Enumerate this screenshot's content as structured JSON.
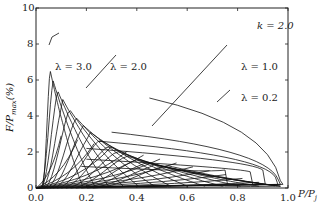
{
  "chart_data": {
    "type": "line",
    "title": "",
    "xlabel": "P/P_j",
    "ylabel": "F/P_max(%)",
    "xlim": [
      0.0,
      1.0
    ],
    "ylim": [
      0,
      10
    ],
    "xticks": [
      "0.0",
      "0.2",
      "0.4",
      "0.6",
      "0.8",
      "1.0"
    ],
    "yticks": [
      "0",
      "2",
      "4",
      "6",
      "8",
      "10"
    ],
    "grid": false,
    "annotations": [
      "k = 2.0",
      "λ = 3.0",
      "λ = 2.0",
      "λ = 1.0",
      "λ = 0.2"
    ],
    "parameter": {
      "k": 2.0
    },
    "series": [
      {
        "name": "λ = 3.0",
        "peak_x": 0.06,
        "peak_y": 6.2
      },
      {
        "name": "λ = 2.0",
        "peak_x": 0.12,
        "peak_y": 4.2
      },
      {
        "name": "λ = 1.0",
        "peak_x": 0.5,
        "peak_y": 2.1
      },
      {
        "name": "λ = 0.2",
        "start_x": 0.45,
        "start_y": 5.0,
        "end_x": 0.97,
        "end_y": 0.3
      }
    ]
  },
  "labels": {
    "k": "k = 2.0",
    "l30": "λ = 3.0",
    "l20": "λ = 2.0",
    "l10": "λ = 1.0",
    "l02": "λ = 0.2",
    "xlabel": "P/P",
    "xsub": "j",
    "ylabel": "F/P",
    "ysub": "max",
    "yunit": "(%)"
  }
}
